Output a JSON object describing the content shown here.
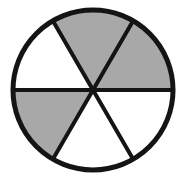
{
  "figure": {
    "name": "circle-divided-into-six-equal-sectors",
    "shape": "circle",
    "title": "",
    "caption": "",
    "background_color": "#ffffff",
    "outline_color": "#141414",
    "shaded_color": "#a8a8a8",
    "unshaded_color": "#ffffff",
    "outline_width_px": 5,
    "spoke_width_px": 4,
    "center": {
      "x": 93,
      "y": 90
    },
    "radius_px": 80,
    "total_sectors": 6,
    "shaded_sectors": 3,
    "unshaded_sectors": 3,
    "sector_angle_degrees": 60,
    "fraction_shaded": "3/6",
    "sectors": [
      {
        "id": "sector-top",
        "label": "top",
        "start_deg": 240,
        "end_deg": 300,
        "fill": "#a8a8a8",
        "state": "shaded"
      },
      {
        "id": "sector-upper-right",
        "label": "upper-right",
        "start_deg": 300,
        "end_deg": 360,
        "fill": "#a8a8a8",
        "state": "shaded"
      },
      {
        "id": "sector-lower-right",
        "label": "lower-right",
        "start_deg": 0,
        "end_deg": 60,
        "fill": "#ffffff",
        "state": "unshaded"
      },
      {
        "id": "sector-bottom",
        "label": "bottom",
        "start_deg": 60,
        "end_deg": 120,
        "fill": "#ffffff",
        "state": "unshaded"
      },
      {
        "id": "sector-lower-left",
        "label": "lower-left",
        "start_deg": 120,
        "end_deg": 180,
        "fill": "#a8a8a8",
        "state": "shaded"
      },
      {
        "id": "sector-upper-left",
        "label": "upper-left",
        "start_deg": 180,
        "end_deg": 240,
        "fill": "#ffffff",
        "state": "unshaded"
      }
    ],
    "spokes": [
      {
        "id": "spoke-horizontal",
        "label": "horizontal-diameter",
        "angle_deg": 0,
        "x1": 13,
        "y1": 90,
        "x2": 173,
        "y2": 90
      },
      {
        "id": "spoke-diagonal-left",
        "label": "diagonal-up-left",
        "angle_deg": 120,
        "x1": 53,
        "y1": 21,
        "x2": 133,
        "y2": 159
      },
      {
        "id": "spoke-diagonal-right",
        "label": "diagonal-up-right",
        "angle_deg": 60,
        "x1": 133,
        "y1": 21,
        "x2": 53,
        "y2": 159
      }
    ]
  }
}
